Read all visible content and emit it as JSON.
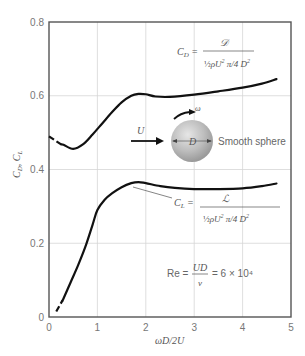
{
  "chart_data": {
    "type": "line",
    "title": "",
    "xlabel": "ωD/2U",
    "ylabel": "C_D, C_L",
    "xlim": [
      0,
      5
    ],
    "ylim": [
      0,
      0.8
    ],
    "x_ticks": [
      "0",
      "1",
      "2",
      "3",
      "4",
      "5"
    ],
    "y_ticks": [
      "0",
      "0.2",
      "0.4",
      "0.6",
      "0.8"
    ],
    "grid": true,
    "legend": "none",
    "series": [
      {
        "name": "C_D",
        "dashed_segment": [
          [
            0.0,
            0.49
          ],
          [
            0.25,
            0.468
          ]
        ],
        "x": [
          0.0,
          0.15,
          0.3,
          0.5,
          0.7,
          0.9,
          1.1,
          1.3,
          1.5,
          1.7,
          1.85,
          2.0,
          2.2,
          2.5,
          3.0,
          3.5,
          4.0,
          4.4,
          4.7
        ],
        "values": [
          0.49,
          0.482,
          0.467,
          0.456,
          0.468,
          0.495,
          0.525,
          0.555,
          0.582,
          0.6,
          0.605,
          0.604,
          0.598,
          0.597,
          0.603,
          0.612,
          0.622,
          0.633,
          0.645
        ]
      },
      {
        "name": "C_L",
        "dashed_segment": [
          [
            0.15,
            0.015
          ],
          [
            0.28,
            0.045
          ]
        ],
        "x": [
          0.15,
          0.3,
          0.45,
          0.6,
          0.75,
          0.9,
          1.0,
          1.15,
          1.3,
          1.5,
          1.7,
          1.85,
          2.0,
          2.3,
          2.6,
          3.0,
          3.5,
          4.0,
          4.4,
          4.7
        ],
        "values": [
          0.015,
          0.05,
          0.095,
          0.14,
          0.19,
          0.25,
          0.29,
          0.318,
          0.335,
          0.352,
          0.363,
          0.366,
          0.363,
          0.355,
          0.35,
          0.347,
          0.347,
          0.349,
          0.355,
          0.362
        ]
      }
    ],
    "annotations": {
      "cd_formula": {
        "lhs": "C_D =",
        "numerator": "𝒟",
        "denominator": "½ρU²(π/4)D²"
      },
      "cl_formula": {
        "lhs": "C_L =",
        "numerator": "ℒ",
        "denominator": "½ρU²(π/4)D²"
      },
      "reynolds": {
        "label": "Re =",
        "numerator": "UD",
        "denominator": "ν",
        "value": "= 6 × 10⁴"
      },
      "flow_label": "U",
      "rotation_label": "ω",
      "diameter_label": "D",
      "sphere_label": "Smooth sphere"
    }
  }
}
